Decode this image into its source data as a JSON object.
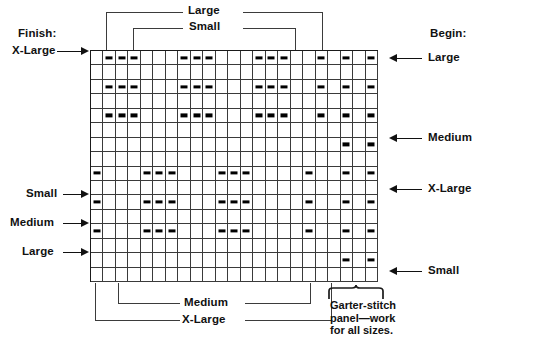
{
  "labels": {
    "finish_header": "Finish:",
    "begin_header": "Begin:",
    "left_xlarge": "X-Large",
    "left_small": "Small",
    "left_medium": "Medium",
    "left_large": "Large",
    "right_large": "Large",
    "right_medium": "Medium",
    "right_xlarge": "X-Large",
    "right_small": "Small",
    "top_large": "Large",
    "top_small": "Small",
    "bottom_medium": "Medium",
    "bottom_xlarge": "X-Large",
    "garter_note": "Garter-stitch\npanel—work\nfor all sizes."
  },
  "chart_data": {
    "type": "table",
    "columns": 23,
    "rows": 16,
    "symbol": "purl-dash",
    "legend": [
      {
        "symbol": "–",
        "meaning": "purl stitch on right side"
      },
      {
        "symbol": "",
        "meaning": "knit stitch on right side"
      }
    ],
    "row_markers_left": [
      {
        "row": 1,
        "label": "X-Large"
      },
      {
        "row": 9,
        "label": "Small"
      },
      {
        "row": 11,
        "label": "Medium"
      },
      {
        "row": 13,
        "label": "Large"
      }
    ],
    "row_markers_right": [
      {
        "row": 1,
        "label": "Large"
      },
      {
        "row": 6,
        "label": "Medium"
      },
      {
        "row": 9,
        "label": "X-Large"
      },
      {
        "row": 16,
        "label": "Small"
      }
    ],
    "column_brackets_top": [
      {
        "label": "Large",
        "start_col": 1,
        "end_col": 23
      },
      {
        "label": "Small",
        "start_col": 3,
        "end_col": 20
      }
    ],
    "column_brackets_bottom": [
      {
        "label": "Medium",
        "start_col": 3,
        "end_col": 20
      },
      {
        "label": "X-Large",
        "start_col": 1,
        "end_col": 23
      }
    ],
    "garter_panel": {
      "start_col": 19,
      "end_col": 23,
      "label": "Garter-stitch panel—work for all sizes."
    },
    "dash_cells": [
      {
        "row": 1,
        "cols": [
          2,
          3,
          4,
          8,
          9,
          10,
          14,
          15,
          16,
          19,
          21,
          23
        ]
      },
      {
        "row": 2,
        "cols": []
      },
      {
        "row": 3,
        "cols": [
          2,
          3,
          4,
          8,
          9,
          10,
          14,
          15,
          16,
          19,
          21,
          23
        ]
      },
      {
        "row": 4,
        "cols": []
      },
      {
        "row": 5,
        "cols": [
          2,
          3,
          4,
          8,
          9,
          10,
          14,
          15,
          16,
          19,
          21,
          23
        ]
      },
      {
        "row": 6,
        "cols": []
      },
      {
        "row": 7,
        "cols": [
          21,
          23
        ]
      },
      {
        "row": 8,
        "cols": []
      },
      {
        "row": 9,
        "cols": [
          1,
          5,
          6,
          7,
          11,
          12,
          13,
          18,
          21,
          23
        ]
      },
      {
        "row": 10,
        "cols": []
      },
      {
        "row": 11,
        "cols": [
          1,
          5,
          6,
          7,
          11,
          12,
          13,
          18,
          21,
          23
        ]
      },
      {
        "row": 12,
        "cols": []
      },
      {
        "row": 13,
        "cols": [
          1,
          5,
          6,
          7,
          11,
          12,
          13,
          18,
          21,
          23
        ]
      },
      {
        "row": 14,
        "cols": []
      },
      {
        "row": 15,
        "cols": [
          21,
          23
        ]
      },
      {
        "row": 16,
        "cols": []
      }
    ]
  },
  "colors": {
    "ink": "#111111",
    "grid_line": "#3a3a3a",
    "leader_line": "#3b3b3b",
    "background": "#ffffff"
  }
}
